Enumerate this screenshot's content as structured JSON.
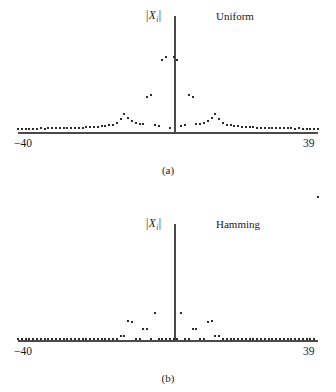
{
  "figure": {
    "background_color": "#ffffff",
    "axis_color": "#4a4a4a",
    "point_color": "#2b2b2b"
  },
  "panels": [
    {
      "caption": "(a)",
      "window_label": "Uniform",
      "ylabel_open": "|",
      "ylabel_symbol": "X",
      "ylabel_subscript": "i",
      "ylabel_close": "|",
      "xtick_left": "−40",
      "xtick_right": "39"
    },
    {
      "caption": "(b)",
      "window_label": "Hamming",
      "ylabel_open": "|",
      "ylabel_symbol": "X",
      "ylabel_subscript": "i",
      "ylabel_close": "|",
      "xtick_left": "−40",
      "xtick_right": "39"
    }
  ],
  "chart_data": [
    {
      "type": "scatter",
      "title": "Uniform",
      "subtitle": "(a)",
      "xlabel": "",
      "ylabel": "| X_i |",
      "xlim": [
        -40,
        39
      ],
      "ylim": [
        0,
        1
      ],
      "xticks": [
        -40,
        39
      ],
      "xticklabels": [
        "−40",
        "39"
      ],
      "grid": false,
      "legend": "none",
      "annotations": [
        "Uniform"
      ],
      "x": [
        -40,
        -39,
        -38,
        -37,
        -36,
        -35,
        -34,
        -33,
        -32,
        -31,
        -30,
        -29,
        -28,
        -27,
        -26,
        -25,
        -24,
        -23,
        -22,
        -21,
        -20,
        -19,
        -18,
        -17,
        -16,
        -15,
        -14,
        -13,
        -12,
        -11,
        -10,
        -9,
        -8,
        -7,
        -6,
        -5,
        -4,
        -3,
        -2,
        -1,
        0,
        1,
        2,
        3,
        4,
        5,
        6,
        7,
        8,
        9,
        10,
        11,
        12,
        13,
        14,
        15,
        16,
        17,
        18,
        19,
        20,
        21,
        22,
        23,
        24,
        25,
        26,
        27,
        28,
        29,
        30,
        31,
        32,
        33,
        34,
        35,
        36,
        37,
        38,
        39
      ],
      "values": [
        0.02,
        0.018,
        0.02,
        0.019,
        0.021,
        0.02,
        0.022,
        0.021,
        0.023,
        0.022,
        0.024,
        0.023,
        0.026,
        0.025,
        0.028,
        0.027,
        0.03,
        0.029,
        0.033,
        0.032,
        0.037,
        0.036,
        0.042,
        0.041,
        0.05,
        0.056,
        0.072,
        0.105,
        0.15,
        0.112,
        0.085,
        0.072,
        0.063,
        0.058,
        0.3,
        0.315,
        0.055,
        0.045,
        0.62,
        0.64,
        0.03,
        0.64,
        0.62,
        0.045,
        0.055,
        0.315,
        0.3,
        0.058,
        0.063,
        0.072,
        0.085,
        0.112,
        0.15,
        0.105,
        0.072,
        0.056,
        0.05,
        0.041,
        0.042,
        0.036,
        0.037,
        0.032,
        0.033,
        0.029,
        0.03,
        0.027,
        0.028,
        0.025,
        0.026,
        0.023,
        0.024,
        0.022,
        0.023,
        0.021,
        0.022,
        0.02,
        0.021,
        0.019,
        0.02,
        0.018
      ]
    },
    {
      "type": "scatter",
      "title": "Hamming",
      "subtitle": "(b)",
      "xlabel": "",
      "ylabel": "| X_i |",
      "xlim": [
        -40,
        39
      ],
      "ylim": [
        0,
        1
      ],
      "xticks": [
        -40,
        39
      ],
      "xticklabels": [
        "−40",
        "39"
      ],
      "grid": false,
      "legend": "none",
      "annotations": [
        "Hamming"
      ],
      "x": [
        -40,
        -39,
        -38,
        -37,
        -36,
        -35,
        -34,
        -33,
        -32,
        -31,
        -30,
        -29,
        -28,
        -27,
        -26,
        -25,
        -24,
        -23,
        -22,
        -21,
        -20,
        -19,
        -18,
        -17,
        -16,
        -15,
        -14,
        -13,
        -12,
        -11,
        -10,
        -9,
        -8,
        -7,
        -6,
        -5,
        -4,
        -3,
        -2,
        -1,
        0,
        1,
        2,
        3,
        4,
        5,
        6,
        7,
        8,
        9,
        10,
        11,
        12,
        13,
        14,
        15,
        16,
        17,
        18,
        19,
        20,
        21,
        22,
        23,
        24,
        25,
        26,
        27,
        28,
        29,
        30,
        31,
        32,
        33,
        34,
        35,
        36,
        37,
        38,
        39
      ],
      "values": [
        0,
        0,
        0,
        0,
        0,
        0,
        0,
        0,
        0,
        0,
        0,
        0,
        0,
        0,
        0,
        0,
        0,
        0,
        0,
        0,
        0,
        0,
        0,
        0,
        0,
        0,
        0,
        0.022,
        0.022,
        0.158,
        0.15,
        0.0,
        0.0,
        0.088,
        0.088,
        0.0,
        0.222,
        0.0,
        0.0,
        0.0,
        0.0,
        0.0,
        0.0,
        0.222,
        0.0,
        0.0,
        0.088,
        0.088,
        0.0,
        0.0,
        0.15,
        0.158,
        0.022,
        0.022,
        0,
        0,
        0,
        0,
        0,
        0,
        0,
        0,
        0,
        0,
        0,
        0,
        0,
        0,
        0,
        0,
        0,
        0,
        0,
        0,
        0,
        0,
        0,
        0,
        0
      ]
    }
  ]
}
